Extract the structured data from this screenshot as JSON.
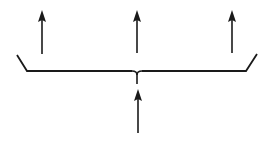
{
  "diagram": {
    "stroke_color": "#1a1a1a",
    "background": "#ffffff",
    "input_arrow": {
      "x": 138,
      "tip_y": 89,
      "tail_y": 133
    },
    "output_arrows": [
      {
        "x": 42,
        "tip_y": 10,
        "tail_y": 54
      },
      {
        "x": 137,
        "tip_y": 10,
        "tail_y": 53
      },
      {
        "x": 232,
        "tip_y": 10,
        "tail_y": 53
      }
    ],
    "brace": {
      "left_top": [
        17,
        55
      ],
      "left_bottom": [
        27,
        71
      ],
      "right_bottom": [
        246,
        71
      ],
      "right_top": [
        257,
        54
      ],
      "cusp": [
        137,
        71
      ],
      "cusp_bottom_y": 84
    }
  }
}
